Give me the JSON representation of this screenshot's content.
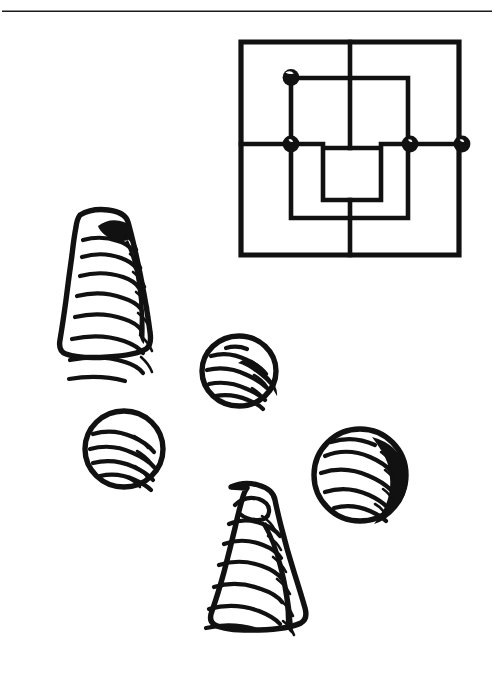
{
  "figure": {
    "caption": "Line drawing of a nine men's morris (mill) board with five marked points and five scattered playing pieces",
    "background_color": "#ffffff",
    "ink_color": "#111111",
    "width": 494,
    "height": 680
  },
  "rule": {
    "name": "top-divider-rule",
    "y": 11,
    "x_start": 2,
    "x_end": 492,
    "thickness": 1.6,
    "color": "#1a1a1a"
  },
  "board": {
    "name": "mill-board",
    "type": "nine-mens-morris",
    "square_count": 3,
    "outer": {
      "left": 239,
      "top": 40,
      "right": 461,
      "bottom": 257
    },
    "middle": {
      "left": 290,
      "top": 77,
      "right": 409,
      "bottom": 219
    },
    "inner": {
      "left": 322,
      "top": 147,
      "right": 382,
      "bottom": 201
    },
    "crosslines": [
      {
        "name": "vertical-midline",
        "x": 350,
        "y1": 40,
        "y2": 257
      },
      {
        "name": "horizontal-midline",
        "y": 144,
        "x1": 239,
        "x2": 461
      }
    ],
    "markers": [
      {
        "name": "marker-middle-top-left",
        "cx": 291,
        "cy": 77,
        "r": 8
      },
      {
        "name": "marker-middle-left-mid",
        "cx": 291,
        "cy": 144,
        "r": 8
      },
      {
        "name": "marker-middle-right-mid",
        "cx": 410,
        "cy": 144,
        "r": 8
      },
      {
        "name": "marker-outer-right-mid",
        "cx": 462,
        "cy": 144,
        "r": 8
      }
    ],
    "marker_count": 4
  },
  "pieces": [
    {
      "name": "cone-piece-upper-left",
      "shape": "cone",
      "label": "tall ridged cone piece",
      "center_x": 99,
      "center_y": 298,
      "width": 92,
      "height": 184,
      "shaded": true
    },
    {
      "name": "disc-piece-center-upper",
      "shape": "disc",
      "label": "round ridged disc piece",
      "center_x": 239,
      "center_y": 371,
      "width": 76,
      "height": 72,
      "shaded": true
    },
    {
      "name": "disc-piece-left-lower",
      "shape": "disc",
      "label": "round ridged disc piece",
      "center_x": 124,
      "center_y": 449,
      "width": 80,
      "height": 78,
      "shaded": false
    },
    {
      "name": "disc-piece-right-lower",
      "shape": "disc",
      "label": "round ridged disc piece",
      "center_x": 360,
      "center_y": 475,
      "width": 94,
      "height": 94,
      "shaded": true
    },
    {
      "name": "cone-piece-bottom-center",
      "shape": "cone",
      "label": "tall ridged cone piece",
      "center_x": 241,
      "center_y": 568,
      "width": 106,
      "height": 168,
      "shaded": true
    }
  ],
  "counts": {
    "cone_pieces": 2,
    "disc_pieces": 3,
    "total_pieces": 5
  }
}
